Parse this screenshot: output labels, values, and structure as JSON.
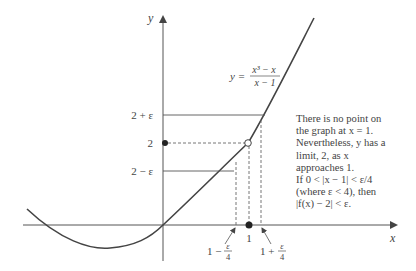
{
  "figure": {
    "type": "epsilon-delta limit illustration",
    "function_label": {
      "lhs": "y =",
      "numerator": "x³ − x",
      "denominator": "x − 1"
    },
    "axes": {
      "x_label": "x",
      "y_label": "y"
    },
    "y_levels": [
      {
        "label": "2 + ε",
        "style": "solid"
      },
      {
        "label": "2",
        "style": "dashed"
      },
      {
        "label": "2 − ε",
        "style": "solid"
      }
    ],
    "x_marks": [
      {
        "label": "1 − ε/4",
        "style": "dashed"
      },
      {
        "label": "1",
        "style": "dashed"
      },
      {
        "label": "1 + ε/4",
        "style": "dashed"
      }
    ],
    "points": [
      {
        "name": "hole-at-x-1",
        "kind": "open",
        "x": 1,
        "y": 2
      },
      {
        "name": "y-axis-2",
        "kind": "filled",
        "x": 0,
        "y": 2
      },
      {
        "name": "x-axis-1",
        "kind": "filled",
        "x": 1,
        "y": 0
      }
    ],
    "annotation_lines": [
      "There is no point on",
      "the graph at x = 1.",
      "Nevertheless, y has a",
      "limit, 2, as x",
      "approaches 1.",
      "If 0 < |x − 1| < ε/4",
      "(where ε < 4), then",
      "|f(x) − 2| < ε."
    ]
  },
  "colors": {
    "ink": "#444444",
    "background": "#ffffff"
  }
}
